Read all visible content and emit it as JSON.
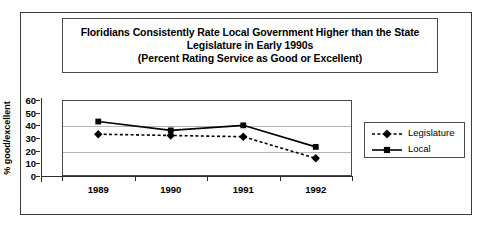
{
  "title": {
    "line1": "Floridians Consistently Rate Local Government Higher than the State",
    "line2": "Legislature in Early 1990s",
    "line3": "(Percent Rating Service as Good or Excellent)"
  },
  "axes": {
    "ylabel": "% good/excellent",
    "yticks": [
      "60",
      "50",
      "40",
      "30",
      "20",
      "10",
      "0"
    ]
  },
  "legend": {
    "items": [
      {
        "label": "Legislature",
        "color": "#000000",
        "style": "dashed",
        "marker": "diamond"
      },
      {
        "label": "Local",
        "color": "#000000",
        "style": "solid",
        "marker": "square"
      }
    ]
  },
  "chart_data": {
    "type": "line",
    "title": "Floridians Consistently Rate Local Government Higher than the State Legislature in Early 1990s (Percent Rating Service as Good or Excellent)",
    "categories": [
      "1989",
      "1990",
      "1991",
      "1992"
    ],
    "series": [
      {
        "name": "Legislature",
        "values": [
          33,
          32,
          31,
          14
        ]
      },
      {
        "name": "Local",
        "values": [
          43,
          36,
          40,
          23
        ]
      }
    ],
    "xlabel": "",
    "ylabel": "% good/excellent",
    "ylim": [
      0,
      60
    ],
    "ytick_step": 10,
    "grid": true,
    "gridlines_at": [
      20,
      40
    ],
    "legend_position": "right"
  }
}
